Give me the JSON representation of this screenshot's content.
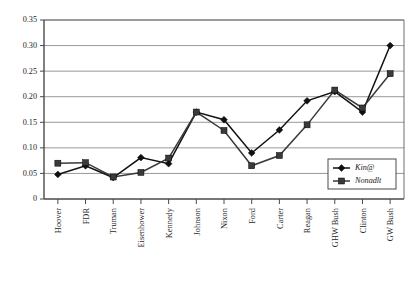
{
  "chart_data": {
    "type": "line",
    "title": "",
    "xlabel": "",
    "ylabel": "",
    "grid": true,
    "legend_position": "inside-bottom-right",
    "ylim": [
      0,
      0.35
    ],
    "yticks": [
      0,
      0.05,
      0.1,
      0.15,
      0.2,
      0.25,
      0.3,
      0.35
    ],
    "ytick_labels": [
      "0",
      "0.05",
      "0.10",
      "0.15",
      "0.20",
      "0.25",
      "0.30",
      "0.35"
    ],
    "categories": [
      "Hoover",
      "FDR",
      "Truman",
      "Eisenhower",
      "Kennedy",
      "Johnson",
      "Nixon",
      "Ford",
      "Carter",
      "Reagan",
      "GHW Bush",
      "Clinton",
      "GW Bush"
    ],
    "series": [
      {
        "name": "Kin@",
        "marker": "diamond",
        "color": "#111111",
        "values": [
          0.048,
          0.065,
          0.042,
          0.081,
          0.069,
          0.17,
          0.155,
          0.09,
          0.135,
          0.192,
          0.21,
          0.17,
          0.3
        ]
      },
      {
        "name": "Nonadlt",
        "marker": "square",
        "color": "#3a3a3a",
        "values": [
          0.07,
          0.071,
          0.043,
          0.052,
          0.08,
          0.17,
          0.134,
          0.065,
          0.085,
          0.145,
          0.213,
          0.178,
          0.245
        ]
      }
    ]
  },
  "legend": {
    "entries": [
      {
        "label": "Kin@",
        "marker": "diamond"
      },
      {
        "label": "Nonadlt",
        "marker": "square"
      }
    ]
  }
}
